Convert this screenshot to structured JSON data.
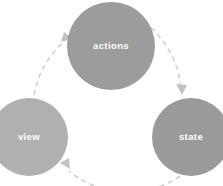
{
  "diagram": {
    "type": "cycle-diagram",
    "title": "",
    "background_color": "#ffffff",
    "canvas": {
      "width": 223,
      "height": 186
    },
    "arrow_color": "#cfcfcf",
    "arrow_head_color": "#c2c2c2",
    "label_color": "#ffffff",
    "dash_pattern": "5 4",
    "arrow_stroke_width": 1.6,
    "nodes": [
      {
        "id": "actions",
        "label": "actions",
        "color": "#9c9c9c",
        "cx": 111,
        "cy": 46,
        "r": 44,
        "font_size": 9.5
      },
      {
        "id": "view",
        "label": "view",
        "color": "#b0b0b0",
        "cx": 29,
        "cy": 137,
        "r": 39,
        "font_size": 9.5
      },
      {
        "id": "state",
        "label": "state",
        "color": "#9a9a9a",
        "cx": 191,
        "cy": 137,
        "r": 39,
        "font_size": 9.5
      }
    ],
    "edges": [
      {
        "id": "actions-to-state",
        "from": "actions",
        "to": "state",
        "style": "dashed-arc"
      },
      {
        "id": "state-to-view",
        "from": "state",
        "to": "view",
        "style": "dashed-arc"
      },
      {
        "id": "view-to-actions",
        "from": "view",
        "to": "actions",
        "style": "dashed-arc"
      }
    ]
  }
}
